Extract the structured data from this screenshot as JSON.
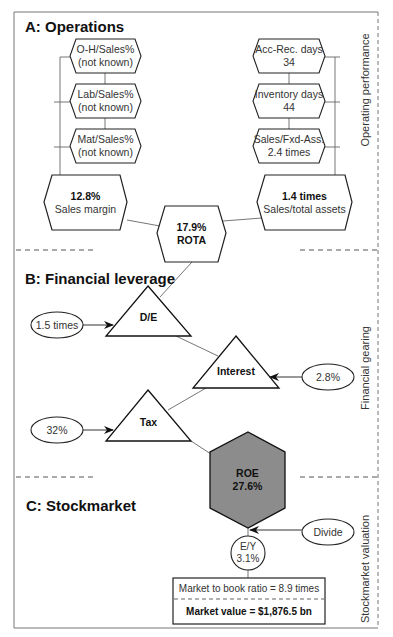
{
  "sections": {
    "a": {
      "title": "A: Operations",
      "side_label": "Operating performance"
    },
    "b": {
      "title": "B: Financial leverage",
      "side_label": "Financial gearing"
    },
    "c": {
      "title": "C: Stockmarket",
      "side_label": "Stockmarket valuation"
    }
  },
  "operations": {
    "left_drivers": [
      {
        "label": "O-H/Sales%",
        "value": "(not known)"
      },
      {
        "label": "Lab/Sales%",
        "value": "(not known)"
      },
      {
        "label": "Mat/Sales%",
        "value": "(not known)"
      }
    ],
    "right_drivers": [
      {
        "label": "Acc-Rec. days",
        "value": "34"
      },
      {
        "label": "Inventory days",
        "value": "44"
      },
      {
        "label": "Sales/Fxd-Ass.",
        "value": "2.4 times"
      }
    ],
    "sales_margin": {
      "value": "12.8%",
      "label": "Sales margin"
    },
    "asset_turnover": {
      "value": "1.4 times",
      "label": "Sales/total assets"
    },
    "rota": {
      "value": "17.9%",
      "label": "ROTA"
    }
  },
  "leverage": {
    "de": {
      "label": "D/E",
      "input": "1.5 times"
    },
    "interest": {
      "label": "Interest",
      "input": "2.8%"
    },
    "tax": {
      "label": "Tax",
      "input": "32%"
    },
    "roe": {
      "label": "ROE",
      "value": "27.6%"
    }
  },
  "stockmarket": {
    "divide": "Divide",
    "ey": {
      "label": "E/Y",
      "value": "3.1%"
    },
    "market_to_book": "Market to book ratio = 8.9 times",
    "market_value": "Market value = $1,876.5 bn"
  },
  "colors": {
    "roe_fill": "#8c8c8c",
    "line": "#222222",
    "connector": "#666666",
    "frame": "#777777"
  }
}
